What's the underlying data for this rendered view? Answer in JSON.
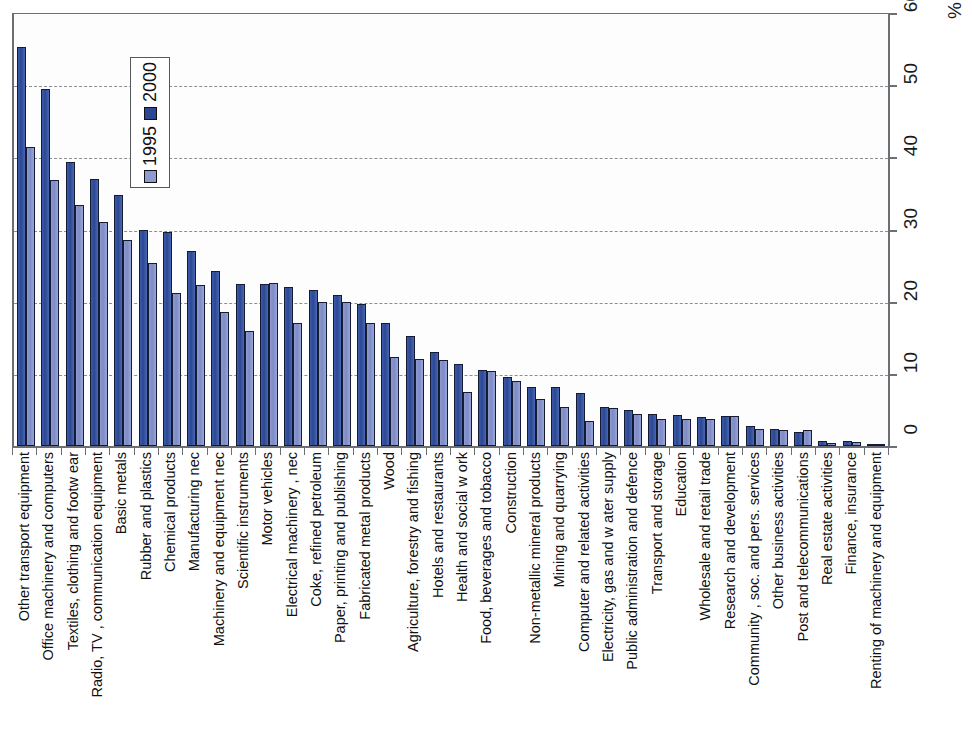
{
  "chart_data": {
    "type": "bar",
    "title": "",
    "subtitle": "",
    "xlabel": "",
    "ylabel": "%",
    "ylim": [
      0,
      60
    ],
    "yticks": [
      0,
      10,
      20,
      30,
      40,
      50,
      60
    ],
    "ytick_labels": [
      "0",
      "10",
      "20",
      "30",
      "40",
      "50",
      "60"
    ],
    "grid": true,
    "grid_axis": "y",
    "legend_position": "upper-left-inside",
    "orientation": "vertical",
    "rotated_labels": true,
    "categories": [
      "Other transport equipment",
      "Office machinery and computers",
      "Textiles, clothing and footw ear",
      "Radio, TV , communication equipment",
      "Basic metals",
      "Rubber and plastics",
      "Chemical products",
      "Manufacturing nec",
      "Machinery and equipment nec",
      "Scientific instruments",
      "Motor vehicles",
      "Electrical machinery , nec",
      "Coke, refined petroleum",
      "Paper, printing and publishing",
      "Fabricated metal products",
      "Wood",
      "Agriculture, forestry and fishing",
      "Hotels and restaurants",
      "Health and social w ork",
      "Food, beverages and tobacco",
      "Construction",
      "Non-metallic mineral products",
      "Mining and quarrying",
      "Computer and related activities",
      "Electricity, gas and w ater supply",
      "Public administration and defence",
      "Transport and storage",
      "Education",
      "Wholesale and retail trade",
      "Research and development",
      "Community , soc. and pers. services",
      "Other business activities",
      "Post and telecommunications",
      "Real estate activities",
      "Finance, insurance",
      "Renting of machinery and equipment"
    ],
    "series": [
      {
        "name": "2000",
        "color": "#2c4894",
        "values": [
          55.3,
          49.5,
          39.3,
          37.0,
          34.8,
          30.0,
          29.6,
          27.0,
          24.3,
          22.4,
          22.4,
          22.0,
          21.6,
          20.9,
          19.7,
          17.0,
          15.3,
          13.0,
          11.4,
          10.5,
          9.6,
          8.2,
          8.2,
          7.3,
          5.4,
          5.0,
          4.5,
          4.3,
          4.0,
          4.2,
          2.8,
          2.4,
          2.0,
          0.7,
          0.7,
          0.0
        ]
      },
      {
        "name": "1995",
        "color": "#8f9bd0",
        "values": [
          41.5,
          36.8,
          33.4,
          31.0,
          28.6,
          25.4,
          21.2,
          22.3,
          18.6,
          16.0,
          22.6,
          17.0,
          19.9,
          19.9,
          17.0,
          12.3,
          12.1,
          11.9,
          7.5,
          10.4,
          9.0,
          6.5,
          5.4,
          3.5,
          5.2,
          4.4,
          3.8,
          3.8,
          3.8,
          4.1,
          2.4,
          2.2,
          2.2,
          0.4,
          0.6,
          0.0
        ]
      }
    ]
  },
  "legend": {
    "entries": [
      {
        "label": "2000",
        "swatch": "legend-swatch-2000"
      },
      {
        "label": "1995",
        "swatch": "legend-swatch-1995"
      }
    ]
  },
  "axis": {
    "percent_symbol": "%"
  }
}
